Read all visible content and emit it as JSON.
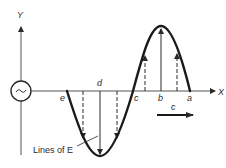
{
  "diagram": {
    "axes": {
      "y_label": "Y",
      "x_label": "X"
    },
    "source": {
      "symbol": "~",
      "icon": "ac-source-icon"
    },
    "points": [
      {
        "id": "e",
        "label": "e"
      },
      {
        "id": "d",
        "label": "d"
      },
      {
        "id": "c",
        "label": "c"
      },
      {
        "id": "b",
        "label": "b"
      },
      {
        "id": "a",
        "label": "a"
      }
    ],
    "propagation": {
      "label": "c",
      "direction": "right"
    },
    "annotation": {
      "label": "Lines of E"
    },
    "colors": {
      "ink": "#2a2a2a",
      "background": "#ffffff"
    }
  }
}
